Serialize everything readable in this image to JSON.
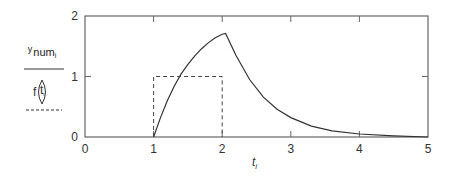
{
  "chart_data": {
    "type": "line",
    "title": "",
    "xlabel": "t",
    "xlabel_subscript": "i",
    "ylabel": "",
    "xlim": [
      0,
      5
    ],
    "ylim": [
      0,
      2
    ],
    "x_ticks": [
      "0",
      "1",
      "2",
      "3",
      "4",
      "5"
    ],
    "y_ticks": [
      "0",
      "1",
      "2"
    ],
    "grid": false,
    "legend": {
      "position": "left",
      "entries": [
        {
          "label": "y num_i",
          "style": "solid"
        },
        {
          "label": "f(t_i)",
          "style": "dashed"
        }
      ]
    },
    "series": [
      {
        "name": "y num_i",
        "style": "solid",
        "x": [
          1.0,
          1.1,
          1.2,
          1.3,
          1.4,
          1.5,
          1.6,
          1.7,
          1.8,
          1.9,
          2.0,
          2.05,
          2.2,
          2.4,
          2.6,
          2.8,
          3.0,
          3.3,
          3.6,
          4.0,
          4.5,
          5.0
        ],
        "values": [
          0.0,
          0.32,
          0.6,
          0.84,
          1.04,
          1.2,
          1.34,
          1.46,
          1.56,
          1.64,
          1.7,
          1.71,
          1.35,
          0.95,
          0.66,
          0.46,
          0.32,
          0.18,
          0.1,
          0.05,
          0.02,
          0.0
        ]
      },
      {
        "name": "f(t_i)",
        "style": "dashed",
        "x": [
          1,
          1,
          2,
          2
        ],
        "values": [
          0,
          1,
          1,
          0
        ]
      }
    ]
  },
  "axis_labels": {
    "x": [
      "0",
      "1",
      "2",
      "3",
      "4",
      "5"
    ],
    "y": [
      "0",
      "1",
      "2"
    ],
    "xlabel": "t",
    "xlabel_sub": "i"
  },
  "legend": {
    "top_prefix": "y",
    "top_text": "num",
    "top_sub": "i",
    "bottom_func": "f",
    "bottom_arg": "t",
    "bottom_arg_sub": "i"
  },
  "colors": {
    "axis": "#555555",
    "series": "#333333"
  }
}
